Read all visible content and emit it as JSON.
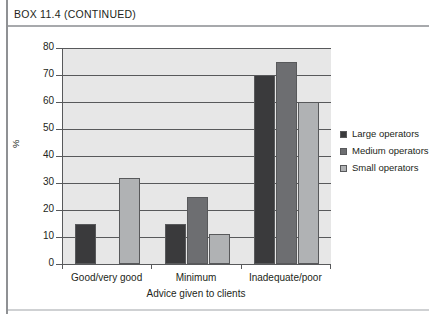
{
  "box": {
    "header": "BOX 11.4 (CONTINUED)"
  },
  "chart_data": {
    "type": "bar",
    "title": "",
    "xlabel": "Advice given to clients",
    "ylabel": "%",
    "categories": [
      "Good/very good",
      "Minimum",
      "Inadequate/poor"
    ],
    "series": [
      {
        "name": "Large operators",
        "color": "#3a3a3c",
        "values": [
          15,
          15,
          70
        ]
      },
      {
        "name": "Medium operators",
        "color": "#6d6e71",
        "values": [
          0,
          25,
          75
        ]
      },
      {
        "name": "Small operators",
        "color": "#b0b2b4",
        "values": [
          32,
          11,
          60
        ]
      }
    ],
    "ylim": [
      0,
      80
    ],
    "yticks": [
      0,
      10,
      20,
      30,
      40,
      50,
      60,
      70,
      80
    ],
    "grid": true,
    "legend_position": "right",
    "plot_background": "#e7e7e7",
    "axis_color": "#58595b"
  }
}
